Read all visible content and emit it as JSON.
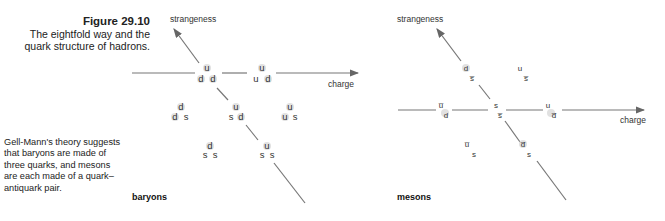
{
  "caption": {
    "figure": "Figure 29.10",
    "lines": [
      "The eightfold way and the",
      "quark structure of hadrons."
    ]
  },
  "note": "Gell-Mann's theory suggests that baryons are made of three quarks, and mesons are each made of a quark–antiquark pair.",
  "baryons": {
    "label": "baryons",
    "axes": {
      "x": "charge",
      "y": "strangeness"
    },
    "particles": [
      {
        "top": "u",
        "left": "d",
        "right": "d"
      },
      {
        "top": "u",
        "left": "u",
        "right": "d"
      },
      {
        "top": "d",
        "left": "d",
        "right": "s"
      },
      {
        "top": "u",
        "left": "s",
        "right": "d"
      },
      {
        "top": "u",
        "left": "u",
        "right": "s"
      },
      {
        "top": "d",
        "left": "s",
        "right": "s"
      },
      {
        "top": "u",
        "left": "s",
        "right": "s"
      }
    ]
  },
  "mesons": {
    "label": "mesons",
    "axes": {
      "x": "charge",
      "y": "strangeness"
    },
    "particles": [
      {
        "top": "d",
        "bottom": "s̅"
      },
      {
        "top": "u",
        "bottom": "s̅"
      },
      {
        "top": "u̅",
        "bottom": "d"
      },
      {
        "top": "s",
        "bottom": "s̅"
      },
      {
        "top": "u",
        "bottom": "d̅"
      },
      {
        "top": "u̅",
        "bottom": "s"
      },
      {
        "top": "d̅",
        "bottom": "s"
      }
    ]
  }
}
